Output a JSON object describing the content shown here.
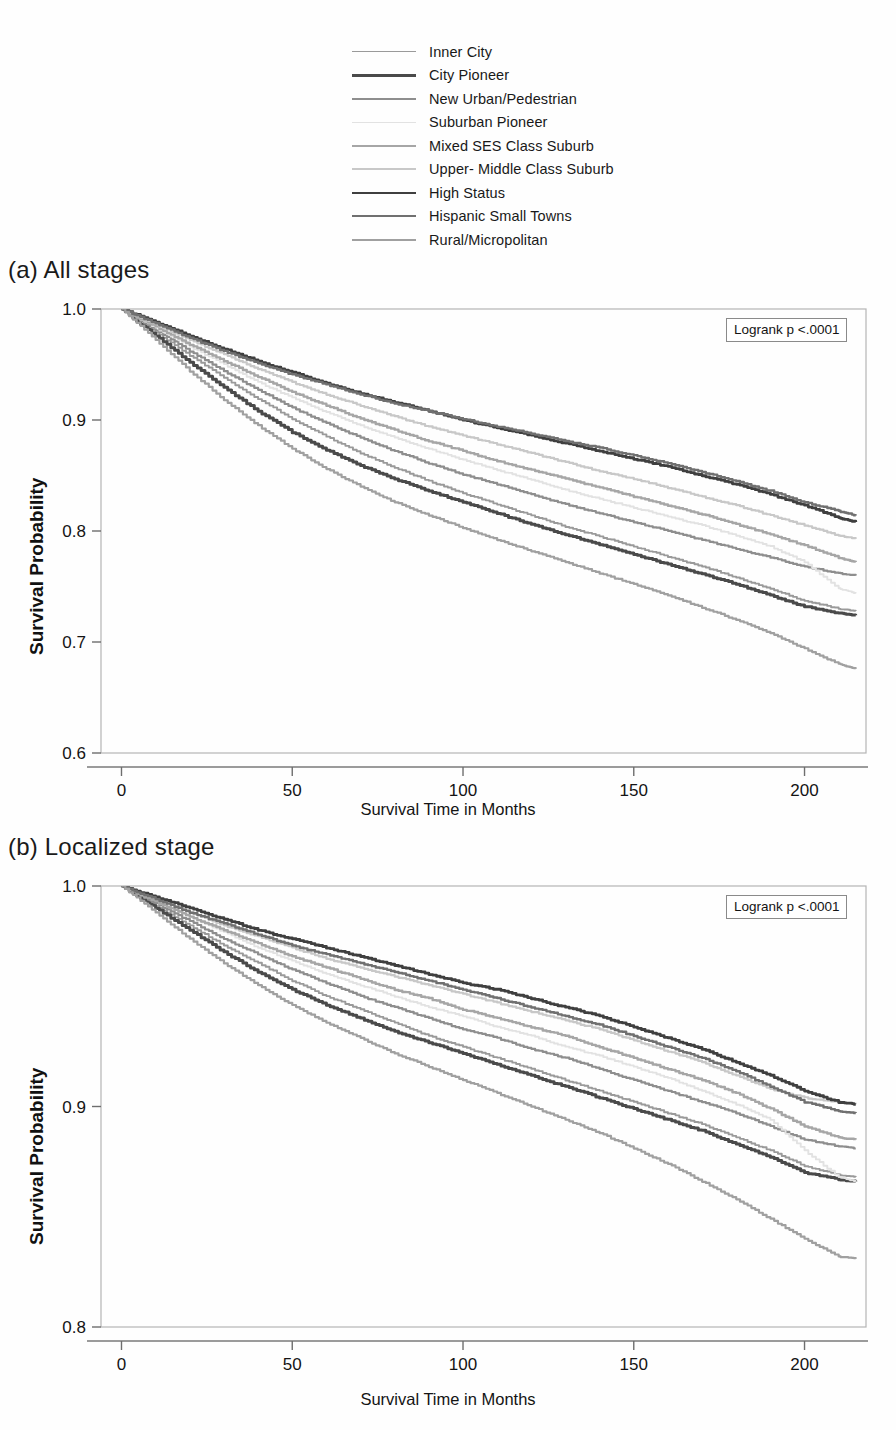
{
  "figure": {
    "type": "kaplan-meier-survival-curves",
    "panel_count": 2
  },
  "legend": {
    "position": "top-center",
    "entries": [
      {
        "label": "Inner City",
        "color": "#9a9a9a",
        "width": 1.9
      },
      {
        "label": "City Pioneer",
        "color": "#4a4a4a",
        "width": 3.0
      },
      {
        "label": "New Urban/Pedestrian",
        "color": "#8e8e8e",
        "width": 2.2
      },
      {
        "label": "Suburban Pioneer",
        "color": "#e2e2e2",
        "width": 1.9
      },
      {
        "label": "Mixed SES Class Suburb",
        "color": "#a6a6a6",
        "width": 2.4
      },
      {
        "label": "Upper- Middle Class Suburb",
        "color": "#c8c8c8",
        "width": 2.2
      },
      {
        "label": "High Status",
        "color": "#3f3f3f",
        "width": 2.8
      },
      {
        "label": "Hispanic Small Towns",
        "color": "#707070",
        "width": 2.4
      },
      {
        "label": "Rural/Micropolitan",
        "color": "#a0a0a0",
        "width": 2.2
      }
    ]
  },
  "panel_a": {
    "title": "(a) All stages",
    "annotation": "Logrank p <.0001",
    "axis": {
      "x_title": "Survival Time in Months",
      "y_title": "Survival Probability",
      "x_ticks": [
        "0",
        "50",
        "100",
        "150",
        "200"
      ],
      "y_ticks": [
        "1.0",
        "0.9",
        "0.8",
        "0.7",
        "0.6"
      ]
    }
  },
  "panel_b": {
    "title": "(b) Localized stage",
    "annotation": "Logrank p <.0001",
    "axis": {
      "x_title": "Survival Time in Months",
      "y_title": "Survival Probability",
      "x_ticks": [
        "0",
        "50",
        "100",
        "150",
        "200"
      ],
      "y_ticks": [
        "1.0",
        "0.9",
        "0.8"
      ]
    }
  },
  "chart_data": [
    {
      "id": "panel_a",
      "type": "line",
      "title": "(a) All stages",
      "xlabel": "Survival Time in Months",
      "ylabel": "Survival Probability",
      "xlim": [
        -6,
        218
      ],
      "ylim": [
        0.6,
        1.0
      ],
      "xticks": [
        0,
        50,
        100,
        150,
        200
      ],
      "yticks": [
        1.0,
        0.9,
        0.8,
        0.7,
        0.6
      ],
      "grid": false,
      "legend_position": "above-plot",
      "annotation": "Logrank p <.0001",
      "x": [
        0,
        10,
        20,
        30,
        40,
        50,
        60,
        70,
        80,
        90,
        100,
        110,
        120,
        130,
        140,
        150,
        160,
        170,
        180,
        190,
        200,
        210,
        215
      ],
      "series": [
        {
          "name": "Inner City",
          "color": "#9a9a9a",
          "values": [
            1.0,
            0.979,
            0.958,
            0.938,
            0.919,
            0.901,
            0.885,
            0.87,
            0.857,
            0.845,
            0.834,
            0.824,
            0.814,
            0.804,
            0.795,
            0.786,
            0.777,
            0.768,
            0.758,
            0.748,
            0.737,
            0.73,
            0.728
          ]
        },
        {
          "name": "City Pioneer",
          "color": "#4a4a4a",
          "values": [
            1.0,
            0.976,
            0.952,
            0.929,
            0.908,
            0.889,
            0.873,
            0.859,
            0.847,
            0.836,
            0.826,
            0.816,
            0.806,
            0.797,
            0.788,
            0.779,
            0.77,
            0.761,
            0.752,
            0.742,
            0.732,
            0.726,
            0.724
          ]
        },
        {
          "name": "New Urban/Pedestrian",
          "color": "#8e8e8e",
          "values": [
            1.0,
            0.981,
            0.962,
            0.944,
            0.927,
            0.911,
            0.897,
            0.884,
            0.872,
            0.861,
            0.851,
            0.842,
            0.833,
            0.824,
            0.816,
            0.808,
            0.8,
            0.792,
            0.784,
            0.776,
            0.768,
            0.762,
            0.76
          ]
        },
        {
          "name": "Suburban Pioneer",
          "color": "#e2e2e2",
          "values": [
            1.0,
            0.983,
            0.966,
            0.95,
            0.934,
            0.92,
            0.907,
            0.895,
            0.884,
            0.874,
            0.864,
            0.855,
            0.846,
            0.837,
            0.829,
            0.821,
            0.813,
            0.805,
            0.796,
            0.786,
            0.772,
            0.748,
            0.744
          ]
        },
        {
          "name": "Mixed SES Class Suburb",
          "color": "#a6a6a6",
          "values": [
            1.0,
            0.984,
            0.968,
            0.953,
            0.939,
            0.925,
            0.913,
            0.901,
            0.891,
            0.881,
            0.872,
            0.863,
            0.855,
            0.847,
            0.839,
            0.831,
            0.823,
            0.815,
            0.806,
            0.797,
            0.787,
            0.776,
            0.772
          ]
        },
        {
          "name": "Upper- Middle Class Suburb",
          "color": "#c8c8c8",
          "values": [
            1.0,
            0.986,
            0.972,
            0.959,
            0.946,
            0.934,
            0.923,
            0.913,
            0.903,
            0.894,
            0.886,
            0.878,
            0.87,
            0.862,
            0.854,
            0.847,
            0.839,
            0.831,
            0.823,
            0.814,
            0.805,
            0.796,
            0.793
          ]
        },
        {
          "name": "High Status",
          "color": "#3f3f3f",
          "values": [
            1.0,
            0.988,
            0.976,
            0.964,
            0.953,
            0.943,
            0.933,
            0.924,
            0.916,
            0.908,
            0.9,
            0.893,
            0.886,
            0.879,
            0.872,
            0.865,
            0.858,
            0.85,
            0.842,
            0.833,
            0.823,
            0.812,
            0.808
          ]
        },
        {
          "name": "Hispanic Small Towns",
          "color": "#707070",
          "values": [
            1.0,
            0.987,
            0.974,
            0.962,
            0.951,
            0.941,
            0.932,
            0.923,
            0.915,
            0.908,
            0.901,
            0.894,
            0.888,
            0.881,
            0.875,
            0.868,
            0.861,
            0.853,
            0.845,
            0.836,
            0.826,
            0.818,
            0.814
          ]
        },
        {
          "name": "Rural/Micropolitan",
          "color": "#a0a0a0",
          "values": [
            1.0,
            0.972,
            0.944,
            0.918,
            0.895,
            0.874,
            0.856,
            0.84,
            0.826,
            0.814,
            0.803,
            0.792,
            0.782,
            0.772,
            0.762,
            0.752,
            0.742,
            0.731,
            0.72,
            0.708,
            0.694,
            0.68,
            0.676
          ]
        }
      ]
    },
    {
      "id": "panel_b",
      "type": "line",
      "title": "(b) Localized stage",
      "xlabel": "Survival Time in Months",
      "ylabel": "Survival Probability",
      "xlim": [
        -6,
        218
      ],
      "ylim": [
        0.8,
        1.0
      ],
      "xticks": [
        0,
        50,
        100,
        150,
        200
      ],
      "yticks": [
        1.0,
        0.9,
        0.8
      ],
      "grid": false,
      "legend_position": "above-plot",
      "annotation": "Logrank p <.0001",
      "x": [
        0,
        10,
        20,
        30,
        40,
        50,
        60,
        70,
        80,
        90,
        100,
        110,
        120,
        130,
        140,
        150,
        160,
        170,
        180,
        190,
        200,
        210,
        215
      ],
      "series": [
        {
          "name": "Inner City",
          "color": "#9a9a9a",
          "values": [
            1.0,
            0.991,
            0.982,
            0.973,
            0.965,
            0.957,
            0.95,
            0.944,
            0.938,
            0.932,
            0.927,
            0.922,
            0.917,
            0.912,
            0.907,
            0.902,
            0.897,
            0.892,
            0.886,
            0.88,
            0.873,
            0.869,
            0.868
          ]
        },
        {
          "name": "City Pioneer",
          "color": "#4a4a4a",
          "values": [
            1.0,
            0.99,
            0.98,
            0.97,
            0.961,
            0.953,
            0.946,
            0.94,
            0.934,
            0.929,
            0.924,
            0.919,
            0.914,
            0.909,
            0.904,
            0.899,
            0.894,
            0.889,
            0.883,
            0.877,
            0.87,
            0.867,
            0.866
          ]
        },
        {
          "name": "New Urban/Pedestrian",
          "color": "#8e8e8e",
          "values": [
            1.0,
            0.992,
            0.984,
            0.976,
            0.969,
            0.962,
            0.956,
            0.95,
            0.945,
            0.94,
            0.935,
            0.931,
            0.926,
            0.922,
            0.917,
            0.912,
            0.907,
            0.902,
            0.897,
            0.891,
            0.885,
            0.882,
            0.881
          ]
        },
        {
          "name": "Suburban Pioneer",
          "color": "#e2e2e2",
          "values": [
            1.0,
            0.993,
            0.986,
            0.979,
            0.972,
            0.966,
            0.96,
            0.955,
            0.95,
            0.945,
            0.941,
            0.936,
            0.932,
            0.927,
            0.923,
            0.918,
            0.913,
            0.907,
            0.901,
            0.894,
            0.88,
            0.868,
            0.866
          ]
        },
        {
          "name": "Mixed SES Class Suburb",
          "color": "#a6a6a6",
          "values": [
            1.0,
            0.993,
            0.986,
            0.98,
            0.974,
            0.968,
            0.963,
            0.958,
            0.953,
            0.949,
            0.944,
            0.94,
            0.936,
            0.932,
            0.927,
            0.922,
            0.917,
            0.912,
            0.906,
            0.899,
            0.891,
            0.886,
            0.885
          ]
        },
        {
          "name": "Upper- Middle Class Suburb",
          "color": "#c8c8c8",
          "values": [
            1.0,
            0.994,
            0.988,
            0.982,
            0.977,
            0.972,
            0.967,
            0.963,
            0.959,
            0.955,
            0.951,
            0.947,
            0.943,
            0.939,
            0.935,
            0.93,
            0.925,
            0.92,
            0.914,
            0.908,
            0.904,
            0.902,
            0.901
          ]
        },
        {
          "name": "High Status",
          "color": "#3f3f3f",
          "values": [
            1.0,
            0.995,
            0.99,
            0.985,
            0.98,
            0.976,
            0.972,
            0.968,
            0.964,
            0.96,
            0.956,
            0.953,
            0.949,
            0.945,
            0.941,
            0.936,
            0.931,
            0.926,
            0.92,
            0.914,
            0.907,
            0.902,
            0.901
          ]
        },
        {
          "name": "Hispanic Small Towns",
          "color": "#707070",
          "values": [
            1.0,
            0.994,
            0.988,
            0.983,
            0.978,
            0.973,
            0.969,
            0.965,
            0.961,
            0.957,
            0.953,
            0.949,
            0.945,
            0.941,
            0.937,
            0.932,
            0.927,
            0.922,
            0.916,
            0.909,
            0.902,
            0.898,
            0.897
          ]
        },
        {
          "name": "Rural/Micropolitan",
          "color": "#a0a0a0",
          "values": [
            1.0,
            0.988,
            0.976,
            0.965,
            0.955,
            0.946,
            0.938,
            0.931,
            0.924,
            0.918,
            0.912,
            0.906,
            0.9,
            0.894,
            0.888,
            0.881,
            0.874,
            0.866,
            0.858,
            0.849,
            0.84,
            0.832,
            0.831
          ]
        }
      ]
    }
  ]
}
